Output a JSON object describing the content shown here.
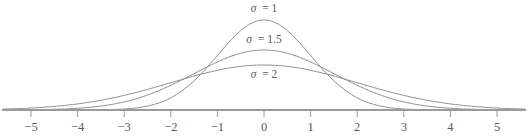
{
  "chart_data": {
    "type": "line",
    "title": "",
    "subtitle": "",
    "xlabel": "",
    "ylabel": "",
    "xlim": [
      -5.6,
      5.6
    ],
    "ylim": [
      0,
      0.42
    ],
    "grid": false,
    "legend_position": "inline-on-curves",
    "distribution": "normal-pdf",
    "mean": 0,
    "x_ticks": [
      -5,
      -4,
      -3,
      -2,
      -1,
      0,
      1,
      2,
      3,
      4,
      5
    ],
    "x_tick_labels": [
      "−5",
      "−4",
      "−3",
      "−2",
      "−1",
      "0",
      "1",
      "2",
      "3",
      "4",
      "5"
    ],
    "y_axis_visible": false,
    "series": [
      {
        "name": "σ = 1",
        "sigma": 1,
        "peak_value": 0.3989,
        "label_symbol": "σ",
        "label_equals": "=",
        "label_value": "1",
        "color": "#8a8a8a",
        "x": [
          -5,
          -4.5,
          -4,
          -3.5,
          -3,
          -2.5,
          -2,
          -1.5,
          -1,
          -0.5,
          0,
          0.5,
          1,
          1.5,
          2,
          2.5,
          3,
          3.5,
          4,
          4.5,
          5
        ],
        "values": [
          1.5e-06,
          1.6e-05,
          0.0001338,
          0.0008727,
          0.0044318,
          0.0175283,
          0.053991,
          0.1295176,
          0.2419707,
          0.3520653,
          0.3989423,
          0.3520653,
          0.2419707,
          0.1295176,
          0.053991,
          0.0175283,
          0.0044318,
          0.0008727,
          0.0001338,
          1.6e-05,
          1.5e-06
        ]
      },
      {
        "name": "σ = 1.5",
        "sigma": 1.5,
        "peak_value": 0.266,
        "label_symbol": "σ",
        "label_equals": "=",
        "label_value": "1.5",
        "color": "#8a8a8a",
        "x": [
          -5,
          -4.5,
          -4,
          -3.5,
          -3,
          -2.5,
          -2,
          -1.5,
          -1,
          -0.5,
          0,
          0.5,
          1,
          1.5,
          2,
          2.5,
          3,
          3.5,
          4,
          4.5,
          5
        ],
        "values": [
          0.0010282,
          0.0029819,
          0.007655,
          0.0173819,
          0.0359403,
          0.0663323,
          0.109335,
          0.1613138,
          0.2129653,
          0.2515888,
          0.2659615,
          0.2515888,
          0.2129653,
          0.1613138,
          0.109335,
          0.0663323,
          0.0359403,
          0.0173819,
          0.007655,
          0.0029819,
          0.0010282
        ]
      },
      {
        "name": "σ = 2",
        "sigma": 2,
        "peak_value": 0.1995,
        "label_symbol": "σ",
        "label_equals": "=",
        "label_value": "2",
        "color": "#8a8a8a",
        "x": [
          -5,
          -4.5,
          -4,
          -3.5,
          -3,
          -2.5,
          -2,
          -1.5,
          -1,
          -0.5,
          0,
          0.5,
          1,
          1.5,
          2,
          2.5,
          3,
          3.5,
          4,
          4.5,
          5
        ],
        "values": [
          0.0087642,
          0.0158309,
          0.0269955,
          0.0434123,
          0.0647588,
          0.0912005,
          0.1209854,
          0.1505687,
          0.1760327,
          0.1933341,
          0.1994711,
          0.1933341,
          0.1760327,
          0.1505687,
          0.1209854,
          0.0912005,
          0.0647588,
          0.0434123,
          0.0269955,
          0.0158309,
          0.0087642
        ]
      }
    ],
    "annotations": [
      {
        "text": "σ = 1",
        "x": 0.0,
        "y_px": 12,
        "series": 0
      },
      {
        "text": "σ = 1.5",
        "x": 0.0,
        "y_px": 43,
        "series": 1
      },
      {
        "text": "σ = 2",
        "x": 0.0,
        "y_px": 78,
        "series": 2
      }
    ],
    "colors": {
      "curve": "#8a8a8a",
      "axis": "#9a9a9a",
      "tick_label": "#5a5a5a",
      "background": "#ffffff"
    }
  }
}
